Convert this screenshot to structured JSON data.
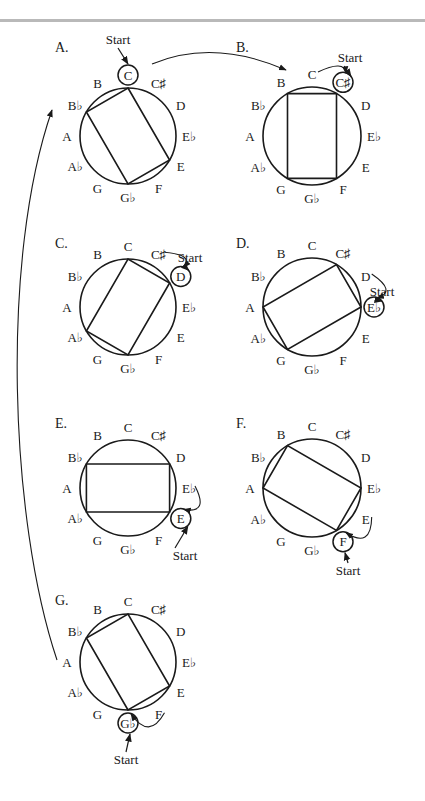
{
  "figure": {
    "rule_color": "#b9b9b9",
    "stroke_color": "#1a1a1a",
    "start_label": "Start",
    "pitch_classes": [
      "C",
      "C♯",
      "D",
      "E♭",
      "E",
      "F",
      "G♭",
      "G",
      "A♭",
      "A",
      "B♭",
      "B"
    ],
    "panels": [
      {
        "id": "A",
        "label": "A.",
        "cx": 128,
        "cy": 136,
        "r": 48,
        "rect": [
          0,
          4,
          6,
          10
        ],
        "start": 0,
        "letter_pos": [
          55,
          52
        ],
        "start_text_pos": [
          118,
          44
        ],
        "start_arrow": "down",
        "prev_arrow": null
      },
      {
        "id": "B",
        "label": "B.",
        "cx": 312,
        "cy": 136,
        "r": 49,
        "rect": [
          1,
          5,
          7,
          11
        ],
        "start": 1,
        "letter_pos": [
          236,
          52
        ],
        "start_text_pos": [
          350,
          62
        ],
        "start_arrow": "ne",
        "prev_arrow": "from-prev"
      },
      {
        "id": "C",
        "label": "C.",
        "cx": 128,
        "cy": 307,
        "r": 48,
        "rect": [
          2,
          6,
          8,
          0
        ],
        "start": 2,
        "letter_pos": [
          55,
          248
        ],
        "start_text_pos": [
          190,
          262
        ],
        "start_arrow": "ne",
        "prev_arrow": "from-prev"
      },
      {
        "id": "D",
        "label": "D.",
        "cx": 312,
        "cy": 307,
        "r": 49,
        "rect": [
          3,
          7,
          9,
          1
        ],
        "start": 3,
        "letter_pos": [
          236,
          248
        ],
        "start_text_pos": [
          382,
          296
        ],
        "start_arrow": "ne",
        "prev_arrow": "from-prev"
      },
      {
        "id": "E",
        "label": "E.",
        "cx": 128,
        "cy": 488,
        "r": 48,
        "rect": [
          4,
          8,
          10,
          2
        ],
        "start": 4,
        "letter_pos": [
          55,
          428
        ],
        "start_text_pos": [
          185,
          560
        ],
        "start_arrow": "se",
        "prev_arrow": "from-prev"
      },
      {
        "id": "F",
        "label": "F.",
        "cx": 312,
        "cy": 488,
        "r": 49,
        "rect": [
          5,
          9,
          11,
          3
        ],
        "start": 5,
        "letter_pos": [
          236,
          428
        ],
        "start_text_pos": [
          348,
          575
        ],
        "start_arrow": "s",
        "prev_arrow": "from-prev"
      },
      {
        "id": "G",
        "label": "G.",
        "cx": 128,
        "cy": 662,
        "r": 48,
        "rect": [
          6,
          10,
          0,
          4
        ],
        "start": 6,
        "letter_pos": [
          55,
          605
        ],
        "start_text_pos": [
          126,
          764
        ],
        "start_arrow": "s",
        "prev_arrow": "from-prev"
      }
    ],
    "connector_arrows": [
      {
        "name": "arrow-a-to-b",
        "path": "M152,64 C195,46 240,50 286,70",
        "head": [
          286,
          70
        ]
      },
      {
        "name": "arrow-g-to-a",
        "path": "M57,660 C10,520 0,260 52,110",
        "head": [
          52,
          110
        ]
      }
    ]
  }
}
